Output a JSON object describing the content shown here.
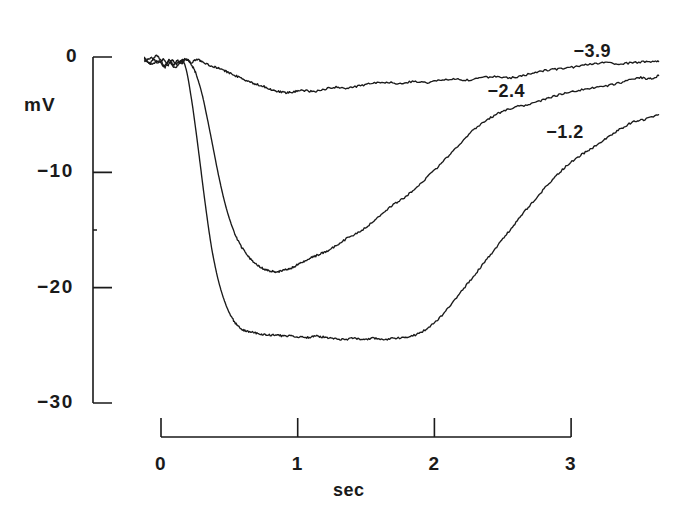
{
  "chart_data": {
    "type": "line",
    "title": "",
    "xlabel": "sec",
    "ylabel": "mV",
    "xlim": [
      -0.15,
      3.75
    ],
    "ylim": [
      -31.5,
      2.0
    ],
    "grid": false,
    "legend_position": "inline-right",
    "x_ticks": [
      "0",
      "1",
      "2",
      "3"
    ],
    "x_tick_values": [
      0,
      1,
      2,
      3
    ],
    "y_ticks": [
      "0",
      "-10",
      "-20",
      "-30"
    ],
    "y_tick_values": [
      0,
      -10,
      -20,
      -30
    ],
    "series": [
      {
        "name": "-3.9",
        "label": "−3.9",
        "label_x": 3.15,
        "label_y": 0.45,
        "min_mv": -3.2,
        "min_time": 0.85,
        "x": [
          -0.12,
          -0.08,
          -0.04,
          0.0,
          0.03,
          0.06,
          0.09,
          0.12,
          0.15,
          0.18,
          0.22,
          0.26,
          0.3,
          0.35,
          0.4,
          0.45,
          0.5,
          0.56,
          0.62,
          0.68,
          0.74,
          0.8,
          0.86,
          0.92,
          0.98,
          1.05,
          1.12,
          1.2,
          1.28,
          1.36,
          1.45,
          1.55,
          1.65,
          1.75,
          1.85,
          1.95,
          2.05,
          2.15,
          2.25,
          2.35,
          2.45,
          2.55,
          2.65,
          2.75,
          2.85,
          2.95,
          3.05,
          3.15,
          3.25,
          3.35,
          3.45,
          3.55,
          3.64
        ],
        "y": [
          -0.1,
          -0.5,
          0.1,
          -0.3,
          -0.9,
          -0.2,
          -0.7,
          -0.3,
          -0.6,
          -0.2,
          -0.5,
          -0.2,
          -0.4,
          -0.7,
          -0.9,
          -1.1,
          -1.4,
          -1.7,
          -2.0,
          -2.3,
          -2.5,
          -2.8,
          -3.0,
          -3.1,
          -3.0,
          -2.9,
          -3.0,
          -2.8,
          -2.6,
          -2.7,
          -2.5,
          -2.3,
          -2.2,
          -2.3,
          -2.1,
          -2.2,
          -2.0,
          -1.9,
          -2.0,
          -1.8,
          -1.7,
          -1.8,
          -1.6,
          -1.3,
          -1.1,
          -1.0,
          -0.8,
          -0.6,
          -0.5,
          -0.6,
          -0.5,
          -0.4,
          -0.4
        ]
      },
      {
        "name": "-2.4",
        "label": "−2.4",
        "label_x": 2.52,
        "label_y": -3.0,
        "min_mv": -18.6,
        "min_time": 0.88,
        "x": [
          -0.12,
          -0.07,
          -0.02,
          0.02,
          0.06,
          0.1,
          0.14,
          0.17,
          0.2,
          0.23,
          0.26,
          0.3,
          0.34,
          0.38,
          0.42,
          0.46,
          0.5,
          0.54,
          0.58,
          0.62,
          0.66,
          0.7,
          0.74,
          0.78,
          0.82,
          0.86,
          0.9,
          0.95,
          1.0,
          1.05,
          1.1,
          1.16,
          1.22,
          1.3,
          1.38,
          1.46,
          1.54,
          1.62,
          1.7,
          1.78,
          1.86,
          1.94,
          2.02,
          2.1,
          2.18,
          2.26,
          2.34,
          2.42,
          2.5,
          2.6,
          2.7,
          2.8,
          2.9,
          3.0,
          3.1,
          3.2,
          3.3,
          3.4,
          3.5,
          3.58,
          3.64
        ],
        "y": [
          -0.2,
          -0.6,
          -0.3,
          -0.8,
          -0.4,
          -0.9,
          -0.5,
          -0.2,
          -0.3,
          -0.8,
          -1.6,
          -3.2,
          -5.4,
          -7.8,
          -10.2,
          -12.3,
          -14.0,
          -15.3,
          -16.3,
          -17.0,
          -17.6,
          -18.0,
          -18.3,
          -18.5,
          -18.6,
          -18.6,
          -18.5,
          -18.3,
          -18.0,
          -17.7,
          -17.4,
          -17.1,
          -16.8,
          -16.2,
          -15.6,
          -15.1,
          -14.4,
          -13.6,
          -12.8,
          -12.2,
          -11.4,
          -10.5,
          -9.6,
          -8.6,
          -7.6,
          -6.6,
          -5.8,
          -5.2,
          -4.7,
          -4.3,
          -4.1,
          -3.7,
          -3.3,
          -3.0,
          -2.8,
          -2.6,
          -2.4,
          -2.1,
          -1.8,
          -1.9,
          -1.6
        ]
      },
      {
        "name": "-1.2",
        "label": "−1.2",
        "label_x": 2.95,
        "label_y": -6.6,
        "min_mv": -24.6,
        "min_time": 1.35,
        "x": [
          -0.12,
          -0.07,
          -0.02,
          0.02,
          0.05,
          0.08,
          0.11,
          0.14,
          0.16,
          0.18,
          0.2,
          0.23,
          0.26,
          0.29,
          0.32,
          0.35,
          0.38,
          0.42,
          0.46,
          0.5,
          0.54,
          0.58,
          0.63,
          0.68,
          0.73,
          0.78,
          0.84,
          0.9,
          0.96,
          1.02,
          1.08,
          1.14,
          1.2,
          1.27,
          1.34,
          1.41,
          1.48,
          1.55,
          1.62,
          1.7,
          1.78,
          1.86,
          1.94,
          2.02,
          2.1,
          2.18,
          2.26,
          2.34,
          2.42,
          2.5,
          2.58,
          2.66,
          2.74,
          2.82,
          2.9,
          2.98,
          3.06,
          3.14,
          3.22,
          3.3,
          3.38,
          3.46,
          3.54,
          3.64
        ],
        "y": [
          -0.4,
          -0.1,
          -0.5,
          -0.2,
          -0.7,
          -0.3,
          -0.6,
          -0.4,
          -0.3,
          -0.9,
          -2.0,
          -4.2,
          -6.8,
          -9.6,
          -12.4,
          -15.0,
          -17.2,
          -19.4,
          -21.0,
          -22.2,
          -23.0,
          -23.5,
          -23.8,
          -23.9,
          -24.0,
          -24.1,
          -24.1,
          -24.2,
          -24.2,
          -24.3,
          -24.3,
          -24.2,
          -24.3,
          -24.4,
          -24.5,
          -24.4,
          -24.5,
          -24.4,
          -24.5,
          -24.4,
          -24.3,
          -24.1,
          -23.6,
          -22.8,
          -21.8,
          -20.6,
          -19.4,
          -18.2,
          -17.0,
          -15.8,
          -14.6,
          -13.4,
          -12.3,
          -11.2,
          -10.2,
          -9.3,
          -8.6,
          -8.0,
          -7.4,
          -6.7,
          -6.1,
          -5.6,
          -5.4,
          -5.0
        ]
      }
    ]
  },
  "axes": {
    "y_axis_name": "mV",
    "x_axis_name": "sec"
  }
}
